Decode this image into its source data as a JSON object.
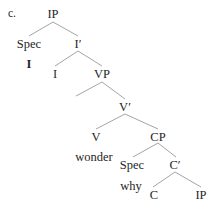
{
  "figure": {
    "item_label": "c.",
    "background_color": "#ffffff",
    "ink_color": "#262626",
    "line_color": "#9a9a9a"
  },
  "tree": {
    "type": "syntax-tree",
    "nodes": [
      {
        "id": "ip-root",
        "text": "IP",
        "x": 53,
        "y": 8,
        "style": "normal"
      },
      {
        "id": "spec-ip",
        "text": "Spec",
        "x": 29,
        "y": 38,
        "style": "normal"
      },
      {
        "id": "ibar",
        "text": "I′",
        "x": 78,
        "y": 38,
        "style": "normal"
      },
      {
        "id": "i-terminal",
        "text": "I",
        "x": 29,
        "y": 58,
        "style": "bold"
      },
      {
        "id": "i-head",
        "text": "I",
        "x": 55,
        "y": 68,
        "style": "normal"
      },
      {
        "id": "vp",
        "text": "VP",
        "x": 102,
        "y": 68,
        "style": "normal"
      },
      {
        "id": "vbar",
        "text": "V′",
        "x": 125,
        "y": 101,
        "style": "normal"
      },
      {
        "id": "v-head",
        "text": "V",
        "x": 96,
        "y": 131,
        "style": "normal"
      },
      {
        "id": "cp",
        "text": "CP",
        "x": 158,
        "y": 131,
        "style": "normal"
      },
      {
        "id": "wonder",
        "text": "wonder",
        "x": 94,
        "y": 151,
        "style": "normal"
      },
      {
        "id": "spec-cp",
        "text": "Spec",
        "x": 132,
        "y": 159,
        "style": "normal"
      },
      {
        "id": "cbar",
        "text": "C′",
        "x": 175,
        "y": 159,
        "style": "normal"
      },
      {
        "id": "why",
        "text": "why",
        "x": 131,
        "y": 180,
        "style": "normal"
      },
      {
        "id": "c-head",
        "text": "C",
        "x": 154,
        "y": 189,
        "style": "normal"
      },
      {
        "id": "ip-embed",
        "text": "IP",
        "x": 201,
        "y": 189,
        "style": "normal"
      }
    ],
    "edges": [
      {
        "id": "ip-to-spec",
        "from": "ip-root",
        "to": "spec-ip",
        "x1": 53,
        "y1": 22,
        "x2": 29,
        "y2": 36
      },
      {
        "id": "ip-to-ibar",
        "from": "ip-root",
        "to": "ibar",
        "x1": 53,
        "y1": 22,
        "x2": 78,
        "y2": 36
      },
      {
        "id": "ibar-to-i",
        "from": "ibar",
        "to": "i-head",
        "x1": 78,
        "y1": 51,
        "x2": 55,
        "y2": 66
      },
      {
        "id": "ibar-to-vp",
        "from": "ibar",
        "to": "vp",
        "x1": 78,
        "y1": 51,
        "x2": 102,
        "y2": 66
      },
      {
        "id": "vp-to-spec",
        "from": "vp",
        "to": "",
        "x1": 102,
        "y1": 82,
        "x2": 76,
        "y2": 96
      },
      {
        "id": "vp-to-vbar",
        "from": "vp",
        "to": "vbar",
        "x1": 102,
        "y1": 82,
        "x2": 125,
        "y2": 99
      },
      {
        "id": "vbar-to-v",
        "from": "vbar",
        "to": "v-head",
        "x1": 125,
        "y1": 114,
        "x2": 96,
        "y2": 129
      },
      {
        "id": "vbar-to-cp",
        "from": "vbar",
        "to": "cp",
        "x1": 125,
        "y1": 114,
        "x2": 158,
        "y2": 129
      },
      {
        "id": "cp-to-spec",
        "from": "cp",
        "to": "spec-cp",
        "x1": 158,
        "y1": 143,
        "x2": 133,
        "y2": 157
      },
      {
        "id": "cp-to-cbar",
        "from": "cp",
        "to": "cbar",
        "x1": 158,
        "y1": 143,
        "x2": 176,
        "y2": 157
      },
      {
        "id": "cbar-to-c",
        "from": "cbar",
        "to": "c-head",
        "x1": 175,
        "y1": 172,
        "x2": 153,
        "y2": 187
      },
      {
        "id": "cbar-to-ip",
        "from": "cbar",
        "to": "ip-embed",
        "x1": 175,
        "y1": 172,
        "x2": 201,
        "y2": 187
      }
    ]
  }
}
